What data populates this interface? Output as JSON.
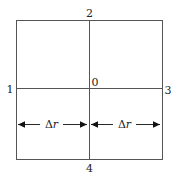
{
  "diagram": {
    "nodes": {
      "center": "0",
      "left": "1",
      "top": "2",
      "right": "3",
      "bottom": "4"
    },
    "spacing": {
      "left_label_delta": "Δ",
      "left_label_var": "r",
      "right_label_delta": "Δ",
      "right_label_var": "r"
    },
    "colors": {
      "line": "#555555",
      "text": "#222222",
      "background": "#ffffff"
    }
  }
}
